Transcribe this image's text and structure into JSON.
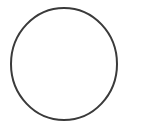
{
  "canvas": {
    "width": 141,
    "height": 127,
    "background_color": "#ffffff"
  },
  "figure": {
    "type": "circle-outline",
    "caption": "",
    "stroke_color": "#3a3a3a",
    "fill_color": "none",
    "stroke_width": 2,
    "center_x": 64,
    "center_y": 64,
    "radius_x": 53,
    "radius_y": 56
  }
}
